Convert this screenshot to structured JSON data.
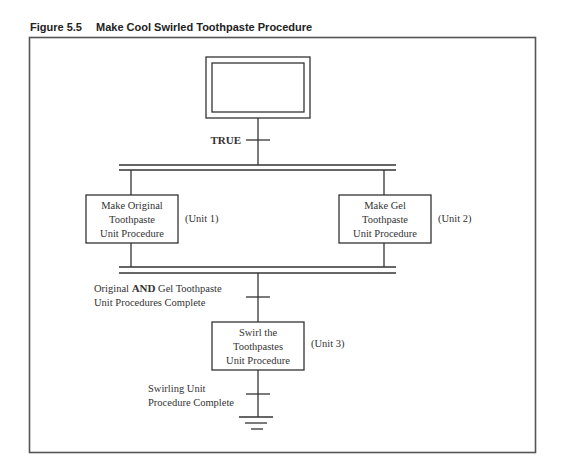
{
  "figure": {
    "number": "Figure 5.5",
    "title": "Make Cool Swirled Toothpaste Procedure"
  },
  "diagram": {
    "initial_step": {
      "label": ""
    },
    "transitions": {
      "start": "TRUE",
      "parallel_complete": {
        "line1_pre": "Original ",
        "line1_bold": "AND",
        "line1_post": " Gel Toothpaste",
        "line2": "Unit Procedures Complete"
      },
      "end": {
        "line1": "Swirling Unit",
        "line2": "Procedure Complete"
      }
    },
    "steps": [
      {
        "lines": [
          "Make Original",
          "Toothpaste",
          "Unit Procedure"
        ],
        "unit": "(Unit 1)"
      },
      {
        "lines": [
          "Make Gel",
          "Toothpaste",
          "Unit Procedure"
        ],
        "unit": "(Unit 2)"
      },
      {
        "lines": [
          "Swirl the",
          "Toothpastes",
          "Unit Procedure"
        ],
        "unit": "(Unit 3)"
      }
    ],
    "colors": {
      "line": "#333333",
      "frame": "#555555"
    }
  }
}
